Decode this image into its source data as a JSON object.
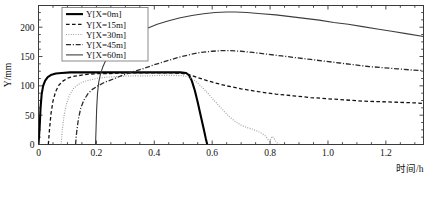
{
  "chart_data": {
    "type": "line",
    "title": "",
    "xlabel": "时间/h",
    "ylabel": "Y/mm",
    "xlim": [
      0,
      1.33
    ],
    "ylim": [
      0,
      237
    ],
    "grid": false,
    "legend_position": "top-left",
    "xticks": [
      "0",
      "0.2",
      "0.4",
      "0.6",
      "0.8",
      "1.0",
      "1.2"
    ],
    "xtick_values": [
      0,
      0.2,
      0.4,
      0.6,
      0.8,
      1.0,
      1.2
    ],
    "yticks": [
      "0",
      "50",
      "100",
      "150",
      "200"
    ],
    "ytick_values": [
      0,
      50,
      100,
      150,
      200
    ],
    "series": [
      {
        "name": "Y[X=0m]",
        "dash": "solid",
        "width": 2.1,
        "color": "#000000",
        "points": [
          [
            0.0,
            0
          ],
          [
            0.004,
            30
          ],
          [
            0.007,
            62
          ],
          [
            0.011,
            86
          ],
          [
            0.016,
            100
          ],
          [
            0.023,
            109
          ],
          [
            0.032,
            115
          ],
          [
            0.045,
            119
          ],
          [
            0.06,
            121
          ],
          [
            0.08,
            122
          ],
          [
            0.11,
            123
          ],
          [
            0.15,
            123
          ],
          [
            0.2,
            123
          ],
          [
            0.26,
            123
          ],
          [
            0.32,
            123
          ],
          [
            0.38,
            123
          ],
          [
            0.44,
            123
          ],
          [
            0.49,
            123
          ],
          [
            0.51,
            122
          ],
          [
            0.52,
            118
          ],
          [
            0.53,
            108
          ],
          [
            0.54,
            92
          ],
          [
            0.55,
            72
          ],
          [
            0.56,
            50
          ],
          [
            0.57,
            28
          ],
          [
            0.578,
            10
          ],
          [
            0.583,
            0
          ]
        ]
      },
      {
        "name": "Y[X=15m]",
        "dash": "dashed",
        "width": 1.3,
        "color": "#111111",
        "points": [
          [
            0.034,
            0
          ],
          [
            0.038,
            26
          ],
          [
            0.043,
            52
          ],
          [
            0.05,
            74
          ],
          [
            0.059,
            90
          ],
          [
            0.07,
            101
          ],
          [
            0.084,
            108
          ],
          [
            0.1,
            113
          ],
          [
            0.12,
            116
          ],
          [
            0.145,
            118
          ],
          [
            0.175,
            120
          ],
          [
            0.21,
            121
          ],
          [
            0.25,
            121
          ],
          [
            0.3,
            122
          ],
          [
            0.36,
            122
          ],
          [
            0.42,
            122
          ],
          [
            0.47,
            122
          ],
          [
            0.5,
            121
          ],
          [
            0.52,
            119
          ],
          [
            0.545,
            115
          ],
          [
            0.575,
            110
          ],
          [
            0.61,
            105
          ],
          [
            0.65,
            100
          ],
          [
            0.7,
            95
          ],
          [
            0.76,
            90
          ],
          [
            0.82,
            86
          ],
          [
            0.88,
            83
          ],
          [
            0.94,
            80
          ],
          [
            1.0,
            78
          ],
          [
            1.06,
            76
          ],
          [
            1.12,
            74
          ],
          [
            1.18,
            73
          ],
          [
            1.24,
            72
          ],
          [
            1.3,
            71
          ],
          [
            1.33,
            70
          ]
        ]
      },
      {
        "name": "Y[X=30m]",
        "dash": "dotted",
        "width": 1.2,
        "color": "#9a9a9a",
        "points": [
          [
            0.078,
            0
          ],
          [
            0.082,
            24
          ],
          [
            0.088,
            48
          ],
          [
            0.096,
            68
          ],
          [
            0.107,
            84
          ],
          [
            0.12,
            95
          ],
          [
            0.136,
            102
          ],
          [
            0.155,
            107
          ],
          [
            0.178,
            110
          ],
          [
            0.205,
            113
          ],
          [
            0.24,
            115
          ],
          [
            0.28,
            116
          ],
          [
            0.325,
            117
          ],
          [
            0.375,
            117
          ],
          [
            0.425,
            118
          ],
          [
            0.47,
            118
          ],
          [
            0.5,
            117
          ],
          [
            0.52,
            115
          ],
          [
            0.54,
            109
          ],
          [
            0.56,
            100
          ],
          [
            0.58,
            90
          ],
          [
            0.6,
            79
          ],
          [
            0.62,
            68
          ],
          [
            0.64,
            57
          ],
          [
            0.66,
            47
          ],
          [
            0.68,
            39
          ],
          [
            0.7,
            33
          ],
          [
            0.72,
            29
          ],
          [
            0.74,
            26
          ],
          [
            0.76,
            22
          ],
          [
            0.775,
            18
          ],
          [
            0.785,
            14
          ],
          [
            0.792,
            9
          ],
          [
            0.798,
            5
          ],
          [
            0.803,
            10
          ],
          [
            0.808,
            14
          ],
          [
            0.814,
            10
          ],
          [
            0.82,
            5
          ],
          [
            0.826,
            2
          ],
          [
            0.832,
            0
          ]
        ]
      },
      {
        "name": "Y[X=45m]",
        "dash": "dashdot",
        "width": 1.3,
        "color": "#2b2b2b",
        "points": [
          [
            0.128,
            0
          ],
          [
            0.132,
            22
          ],
          [
            0.138,
            44
          ],
          [
            0.146,
            62
          ],
          [
            0.157,
            76
          ],
          [
            0.17,
            86
          ],
          [
            0.186,
            94
          ],
          [
            0.205,
            100
          ],
          [
            0.228,
            106
          ],
          [
            0.255,
            111
          ],
          [
            0.285,
            117
          ],
          [
            0.32,
            123
          ],
          [
            0.36,
            129
          ],
          [
            0.4,
            136
          ],
          [
            0.44,
            142
          ],
          [
            0.48,
            148
          ],
          [
            0.52,
            153
          ],
          [
            0.56,
            157
          ],
          [
            0.6,
            159
          ],
          [
            0.63,
            160
          ],
          [
            0.66,
            160
          ],
          [
            0.7,
            159
          ],
          [
            0.74,
            157
          ],
          [
            0.79,
            154
          ],
          [
            0.84,
            151
          ],
          [
            0.89,
            148
          ],
          [
            0.94,
            145
          ],
          [
            0.99,
            142
          ],
          [
            1.04,
            139
          ],
          [
            1.09,
            136
          ],
          [
            1.14,
            133
          ],
          [
            1.19,
            131
          ],
          [
            1.24,
            129
          ],
          [
            1.29,
            127
          ],
          [
            1.33,
            126
          ]
        ]
      },
      {
        "name": "Y[X=60m]",
        "dash": "solid",
        "width": 1.1,
        "color": "#3d3d3d",
        "points": [
          [
            0.197,
            0
          ],
          [
            0.199,
            30
          ],
          [
            0.201,
            62
          ],
          [
            0.204,
            88
          ],
          [
            0.208,
            106
          ],
          [
            0.214,
            120
          ],
          [
            0.222,
            132
          ],
          [
            0.232,
            143
          ],
          [
            0.245,
            153
          ],
          [
            0.26,
            162
          ],
          [
            0.28,
            171
          ],
          [
            0.305,
            180
          ],
          [
            0.335,
            189
          ],
          [
            0.37,
            197
          ],
          [
            0.41,
            205
          ],
          [
            0.45,
            211
          ],
          [
            0.49,
            216
          ],
          [
            0.53,
            220
          ],
          [
            0.57,
            223
          ],
          [
            0.61,
            225
          ],
          [
            0.65,
            226
          ],
          [
            0.68,
            226
          ],
          [
            0.72,
            225
          ],
          [
            0.77,
            223
          ],
          [
            0.82,
            221
          ],
          [
            0.87,
            218
          ],
          [
            0.92,
            215
          ],
          [
            0.97,
            212
          ],
          [
            1.02,
            208
          ],
          [
            1.07,
            205
          ],
          [
            1.12,
            201
          ],
          [
            1.17,
            197
          ],
          [
            1.22,
            193
          ],
          [
            1.27,
            189
          ],
          [
            1.33,
            184
          ]
        ]
      }
    ]
  },
  "axes": {
    "x_label": "时间/h",
    "y_label": "Y/mm"
  }
}
